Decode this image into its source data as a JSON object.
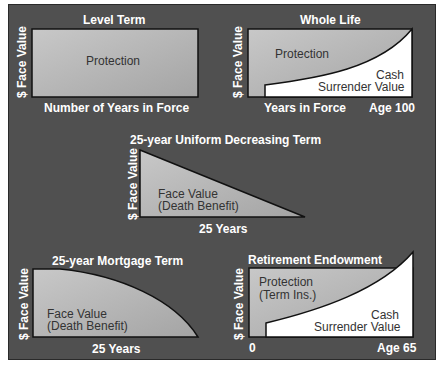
{
  "diagrams": {
    "level_term": {
      "title": "Level Term",
      "area_label": "Protection",
      "x_label": "Number of Years in Force",
      "y_label": "$ Face Value"
    },
    "whole_life": {
      "title": "Whole Life",
      "protection_label": "Protection",
      "cash_label_1": "Cash",
      "cash_label_2": "Surrender Value",
      "x_label": "Years in Force",
      "x_end_label": "Age 100",
      "y_label": "$ Face Value"
    },
    "decreasing_term": {
      "title": "25-year Uniform Decreasing Term",
      "area_label_1": "Face Value",
      "area_label_2": "(Death Benefit)",
      "x_label": "25 Years",
      "y_label": "$ Face Value"
    },
    "mortgage_term": {
      "title": "25-year Mortgage Term",
      "area_label_1": "Face Value",
      "area_label_2": "(Death Benefit)",
      "x_label": "25 Years",
      "y_label": "$ Face Value"
    },
    "retirement_endowment": {
      "title": "Retirement Endowment",
      "protection_label_1": "Protection",
      "protection_label_2": "(Term Ins.)",
      "cash_label_1": "Cash",
      "cash_label_2": "Surrender Value",
      "x_start_label": "0",
      "x_end_label": "Age 65",
      "y_label": "$ Face Value"
    }
  },
  "colors": {
    "background": "#505050",
    "area_fill": "#b8b8b8",
    "cash_fill": "#ffffff",
    "text_light": "#ffffff",
    "text_dark": "#333333"
  }
}
